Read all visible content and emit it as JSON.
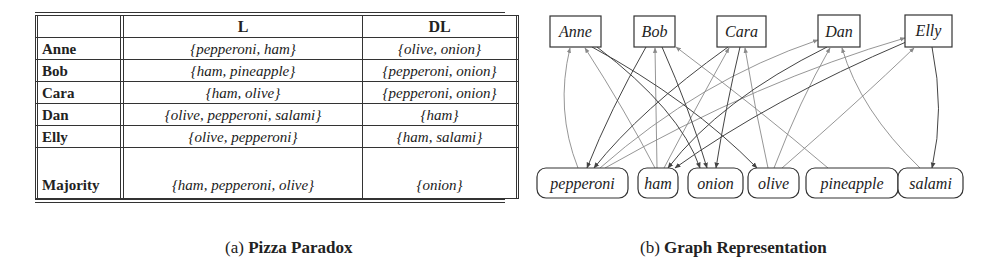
{
  "panel_a": {
    "caption_prefix": "(a)",
    "caption_title": "Pizza Paradox",
    "table": {
      "columns": [
        "",
        "L",
        "DL"
      ],
      "rows": [
        {
          "name": "Anne",
          "L": "{pepperoni, ham}",
          "DL": "{olive, onion}"
        },
        {
          "name": "Bob",
          "L": "{ham, pineapple}",
          "DL": "{pepperoni, onion}"
        },
        {
          "name": "Cara",
          "L": "{ham, olive}",
          "DL": "{pepperoni, onion}"
        },
        {
          "name": "Dan",
          "L": "{olive, pepperoni, salami}",
          "DL": "{ham}"
        },
        {
          "name": "Elly",
          "L": "{olive, pepperoni}",
          "DL": "{ham, salami}"
        },
        {
          "name": "Majority",
          "L": "{ham, pepperoni, olive}",
          "DL": "{onion}"
        }
      ]
    }
  },
  "panel_b": {
    "caption_prefix": "(b)",
    "caption_title": "Graph Representation",
    "people": [
      "Anne",
      "Bob",
      "Cara",
      "Dan",
      "Elly"
    ],
    "foods": [
      "pepperoni",
      "ham",
      "onion",
      "olive",
      "pineapple",
      "salami"
    ],
    "likes_edges_food_to_person": [
      [
        "pepperoni",
        "Anne"
      ],
      [
        "ham",
        "Anne"
      ],
      [
        "ham",
        "Bob"
      ],
      [
        "pineapple",
        "Bob"
      ],
      [
        "ham",
        "Cara"
      ],
      [
        "olive",
        "Cara"
      ],
      [
        "olive",
        "Dan"
      ],
      [
        "pepperoni",
        "Dan"
      ],
      [
        "salami",
        "Dan"
      ],
      [
        "olive",
        "Elly"
      ],
      [
        "pepperoni",
        "Elly"
      ]
    ],
    "dislikes_edges_person_to_food": [
      [
        "Anne",
        "olive"
      ],
      [
        "Anne",
        "onion"
      ],
      [
        "Bob",
        "pepperoni"
      ],
      [
        "Bob",
        "onion"
      ],
      [
        "Cara",
        "pepperoni"
      ],
      [
        "Cara",
        "onion"
      ],
      [
        "Dan",
        "ham"
      ],
      [
        "Elly",
        "ham"
      ],
      [
        "Elly",
        "salami"
      ]
    ],
    "colors": {
      "likes_edge": "#8a8a8a",
      "dislikes_edge": "#444444",
      "node_border": "#333333"
    }
  }
}
